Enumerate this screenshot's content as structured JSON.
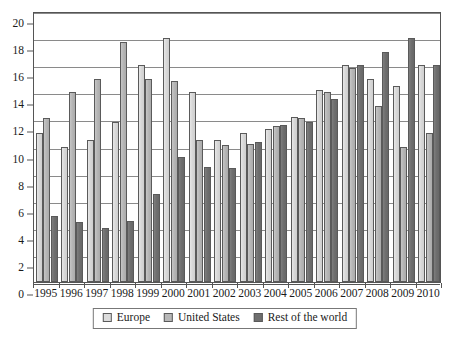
{
  "chart_data": {
    "type": "bar",
    "title": "",
    "xlabel": "",
    "ylabel": "",
    "ylim": [
      0,
      20
    ],
    "ytick_step": 2,
    "yticks": [
      0,
      2,
      4,
      6,
      8,
      10,
      12,
      14,
      16,
      18,
      20
    ],
    "grid": true,
    "legend_position": "bottom",
    "categories": [
      "1995",
      "1996",
      "1997",
      "1998",
      "1999",
      "2000",
      "2001",
      "2002",
      "2003",
      "2004",
      "2005",
      "2006",
      "2007",
      "2008",
      "2009",
      "2010"
    ],
    "series": [
      {
        "name": "Europe",
        "color": "#dcdcdc",
        "values": [
          11.0,
          10.0,
          10.5,
          11.8,
          16.0,
          18.0,
          14.0,
          10.5,
          11.0,
          11.3,
          12.2,
          14.2,
          16.0,
          15.0,
          14.5,
          16.0
        ]
      },
      {
        "name": "United States",
        "color": "#b8b8b8",
        "values": [
          12.1,
          14.0,
          15.0,
          17.7,
          15.0,
          14.8,
          10.5,
          10.1,
          10.2,
          11.5,
          12.1,
          14.0,
          15.8,
          13.0,
          10.0,
          11.0
        ]
      },
      {
        "name": "Rest of the world",
        "color": "#6f6f6f",
        "values": [
          4.9,
          4.4,
          4.0,
          4.5,
          6.5,
          9.2,
          8.5,
          8.4,
          10.3,
          11.6,
          11.8,
          13.5,
          16.0,
          17.0,
          18.0,
          16.0
        ]
      }
    ]
  },
  "legend": {
    "items": [
      {
        "label": "Europe",
        "swatch_class": "series-europe"
      },
      {
        "label": "United States",
        "swatch_class": "series-us"
      },
      {
        "label": "Rest of the world",
        "swatch_class": "series-row"
      }
    ]
  }
}
